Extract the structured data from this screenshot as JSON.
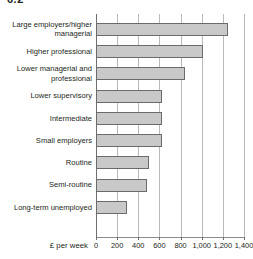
{
  "figure": {
    "heading": "6.2"
  },
  "chart_data": {
    "type": "bar",
    "orientation": "horizontal",
    "title": "",
    "subtitle": "",
    "xlabel": "£ per week",
    "ylabel": "",
    "xlim": [
      0,
      1400
    ],
    "xticks": [
      0,
      200,
      400,
      600,
      800,
      1000,
      1200,
      1400
    ],
    "xticklabels": [
      "0",
      "200",
      "400",
      "600",
      "800",
      "1,000",
      "1,200",
      "1,400"
    ],
    "grid": "vertical",
    "legend": "none",
    "bar_color": "#c9c9c9",
    "bar_border_color": "#6b6b6b",
    "gridline_color": "#b9b9b9",
    "axis_color": "#8a8a8a",
    "categories": [
      "Large employers/higher managerial",
      "Higher professional",
      "Lower managerial and professional",
      "Lower supervisory",
      "Intermediate",
      "Small employers",
      "Routine",
      "Semi-routine",
      "Long-term unemployed"
    ],
    "values": [
      1250,
      1010,
      840,
      620,
      620,
      620,
      500,
      480,
      290
    ],
    "bars": [
      {
        "label_lines": [
          "Large employers/higher",
          "managerial"
        ],
        "value": 1250
      },
      {
        "label_lines": [
          "Higher professional"
        ],
        "value": 1010
      },
      {
        "label_lines": [
          "Lower managerial and",
          "professional"
        ],
        "value": 840
      },
      {
        "label_lines": [
          "Lower supervisory"
        ],
        "value": 620
      },
      {
        "label_lines": [
          "Intermediate"
        ],
        "value": 620
      },
      {
        "label_lines": [
          "Small employers"
        ],
        "value": 620
      },
      {
        "label_lines": [
          "Routine"
        ],
        "value": 500
      },
      {
        "label_lines": [
          "Semi-routine"
        ],
        "value": 480
      },
      {
        "label_lines": [
          "Long-term unemployed"
        ],
        "value": 290
      }
    ]
  }
}
